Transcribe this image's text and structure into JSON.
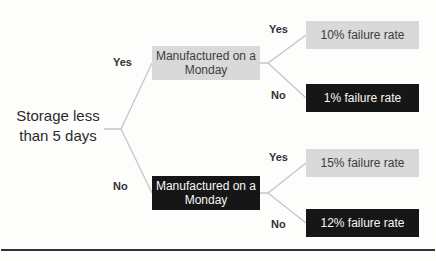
{
  "tree": {
    "root_label": "Storage less\nthan 5 days",
    "level1": {
      "yes_label": "Yes",
      "no_label": "No",
      "yes_node_label": "Manufactured on a\nMonday",
      "no_node_label": "Manufactured on a\nMonday"
    },
    "level2_top": {
      "yes_label": "Yes",
      "no_label": "No",
      "yes_leaf_label": "10% failure rate",
      "no_leaf_label": "1% failure rate"
    },
    "level2_bottom": {
      "yes_label": "Yes",
      "no_label": "No",
      "yes_leaf_label": "15% failure rate",
      "no_leaf_label": "12% failure rate"
    }
  },
  "colors": {
    "light_node_bg": "#d9d9d9",
    "dark_node_bg": "#161616",
    "light_node_text": "#3d3d3d",
    "dark_node_text": "#f7f7f7",
    "connector_line": "#c6c6c6",
    "bottom_rule": "#333333"
  }
}
